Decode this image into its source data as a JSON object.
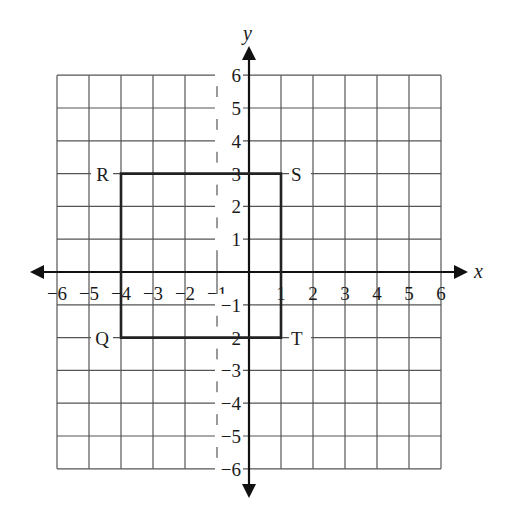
{
  "axes": {
    "x_label": "x",
    "y_label": "y",
    "x_range": [
      -6,
      6
    ],
    "y_range": [
      -6,
      6
    ],
    "x_ticks": [
      "−6",
      "−5",
      "−4",
      "−3",
      "−2",
      "−1",
      "1",
      "2",
      "3",
      "4",
      "5",
      "6"
    ],
    "y_ticks": [
      "6",
      "5",
      "4",
      "3",
      "2",
      "1",
      "−1",
      "−2",
      "−3",
      "−4",
      "−5",
      "−6"
    ]
  },
  "rectangle": {
    "vertices": [
      {
        "label": "R",
        "x": -4,
        "y": 3
      },
      {
        "label": "S",
        "x": 1,
        "y": 3
      },
      {
        "label": "T",
        "x": 1,
        "y": -2
      },
      {
        "label": "Q",
        "x": -4,
        "y": -2
      }
    ]
  },
  "colors": {
    "grid": "#555555",
    "axis": "#111111",
    "shape": "#222222"
  }
}
